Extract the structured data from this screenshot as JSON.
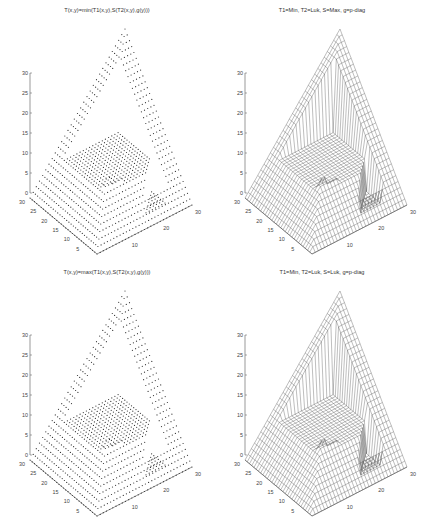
{
  "figure": {
    "panels": [
      {
        "id": "top-left",
        "title": "T(x,y)=min(T1(x,y),S(T2(x,y),g(y)))",
        "style": "dots"
      },
      {
        "id": "top-right",
        "title": "T1=Min, T2=Luk, S=Max, g=p-diag",
        "style": "mesh"
      },
      {
        "id": "bottom-left",
        "title": "T(x,y)=max(T1(x,y),S(T2(x,y),g(y)))",
        "style": "dots"
      },
      {
        "id": "bottom-right",
        "title": "T1=Min, T2=Luk, S=Luk, g=p-diag",
        "style": "mesh"
      }
    ]
  },
  "chart_data": [
    {
      "type": "surface3d",
      "title": "T(x,y)=min(T1(x,y),S(T2(x,y),g(y)))",
      "render": "scatter-dots",
      "axes": {
        "z": {
          "ticks": [
            0,
            5,
            10,
            15,
            20,
            25,
            30
          ],
          "range": [
            0,
            30
          ]
        },
        "y": {
          "ticks": [
            5,
            10,
            15,
            20,
            25,
            30
          ],
          "range": [
            0,
            30
          ]
        },
        "x": {
          "ticks": [
            10,
            20,
            30
          ],
          "range": [
            0,
            30
          ]
        }
      },
      "grid": false
    },
    {
      "type": "surface3d",
      "title": "T1=Min, T2=Luk, S=Max, g=p-diag",
      "render": "wireframe",
      "axes": {
        "z": {
          "ticks": [
            0,
            5,
            10,
            15,
            20,
            25,
            30
          ],
          "range": [
            0,
            30
          ]
        },
        "y": {
          "ticks": [
            5,
            10,
            15,
            20,
            25,
            30
          ],
          "range": [
            0,
            30
          ]
        },
        "x": {
          "ticks": [
            10,
            20,
            30
          ],
          "range": [
            0,
            30
          ]
        }
      },
      "grid": false
    },
    {
      "type": "surface3d",
      "title": "T(x,y)=max(T1(x,y),S(T2(x,y),g(y)))",
      "render": "scatter-dots",
      "axes": {
        "z": {
          "ticks": [
            0,
            5,
            10,
            15,
            20,
            25,
            30
          ],
          "range": [
            0,
            30
          ]
        },
        "y": {
          "ticks": [
            5,
            10,
            15,
            20,
            25,
            30
          ],
          "range": [
            0,
            30
          ]
        },
        "x": {
          "ticks": [
            10,
            20,
            30
          ],
          "range": [
            0,
            30
          ]
        }
      },
      "grid": false
    },
    {
      "type": "surface3d",
      "title": "T1=Min, T2=Luk, S=Luk, g=p-diag",
      "render": "wireframe",
      "axes": {
        "z": {
          "ticks": [
            0,
            5,
            10,
            15,
            20,
            25,
            30
          ],
          "range": [
            0,
            30
          ]
        },
        "y": {
          "ticks": [
            5,
            10,
            15,
            20,
            25,
            30
          ],
          "range": [
            0,
            30
          ]
        },
        "x": {
          "ticks": [
            10,
            20,
            30
          ],
          "range": [
            0,
            30
          ]
        }
      },
      "grid": false
    }
  ]
}
